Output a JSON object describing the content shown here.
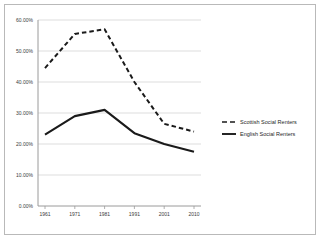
{
  "chart_data": {
    "type": "line",
    "title": "",
    "subtitle": "",
    "xlabel": "",
    "ylabel": "",
    "categories": [
      "1961",
      "1971",
      "1981",
      "1991",
      "2001",
      "2010"
    ],
    "series": [
      {
        "name": "Scottish Social Renters",
        "style": "dashed",
        "color": "#1a1a1a",
        "values": [
          44.5,
          55.5,
          57.0,
          40.0,
          26.5,
          24.0
        ]
      },
      {
        "name": "English Social Renters",
        "style": "solid",
        "color": "#1a1a1a",
        "values": [
          23.0,
          29.0,
          31.0,
          23.5,
          20.0,
          17.5
        ]
      }
    ],
    "ylim": [
      0,
      60
    ],
    "ytick_values": [
      0,
      10,
      20,
      30,
      40,
      50,
      60
    ],
    "ytick_labels": [
      "0.00%",
      "10.00%",
      "20.00%",
      "30.00%",
      "40.00%",
      "50.00%",
      "60.00%"
    ],
    "grid": true,
    "grid_color": "#d4d4d4",
    "legend_position": "right",
    "axis_color": "#9a9a9a",
    "border_color": "#b9b9b9",
    "plot_background": "#ffffff"
  },
  "legend": {
    "entries": [
      {
        "label": "Scottish Social Renters",
        "style": "dashed"
      },
      {
        "label": "English Social Renters",
        "style": "solid"
      }
    ]
  }
}
